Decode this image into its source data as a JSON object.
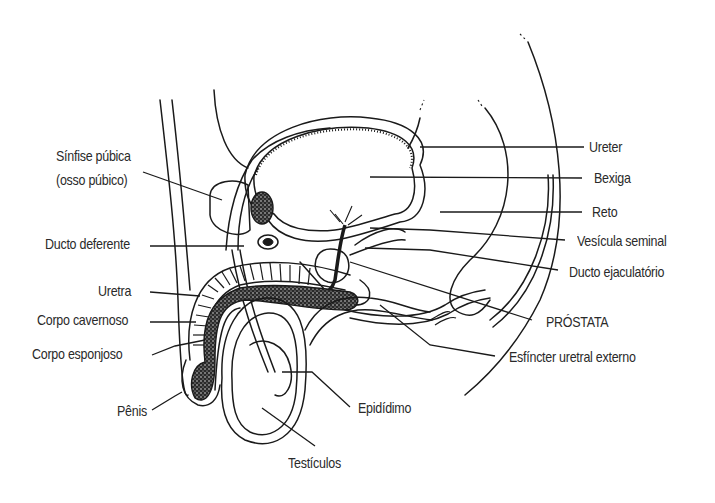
{
  "figure": {
    "ink_color": "#1a1a1a",
    "background": "#ffffff"
  },
  "labels": {
    "left": {
      "sinfise_line1": "Sínfise púbica",
      "sinfise_line2": "(osso púbico)",
      "ducto_deferente": "Ducto deferente",
      "uretra": "Uretra",
      "corpo_cavernoso": "Corpo cavernoso",
      "corpo_esponjoso": "Corpo esponjoso",
      "penis": "Pênis"
    },
    "right": {
      "ureter": "Ureter",
      "bexiga": "Bexiga",
      "reto": "Reto",
      "vesicula_seminal": "Vesícula seminal",
      "ducto_ejaculatorio": "Ducto ejaculatório",
      "prostata": "PRÓSTATA",
      "esfincter": "Esfíncter uretral externo"
    },
    "bottom": {
      "epididimo": "Epidídimo",
      "testiculos": "Testículos"
    }
  }
}
